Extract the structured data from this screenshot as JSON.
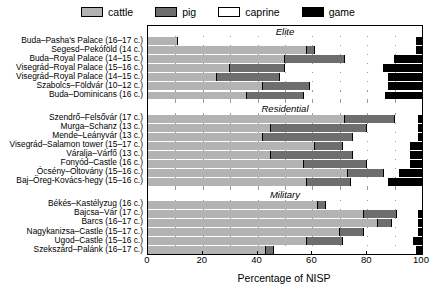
{
  "legend": {
    "items": [
      {
        "label": "cattle",
        "color": "#b3b3b3",
        "icon": "square-swatch-icon"
      },
      {
        "label": "pig",
        "color": "#6e6e6e",
        "icon": "square-swatch-icon"
      },
      {
        "label": "caprine",
        "color": "#ffffff",
        "icon": "square-swatch-icon"
      },
      {
        "label": "game",
        "color": "#000000",
        "icon": "square-swatch-icon"
      }
    ]
  },
  "axis": {
    "x_title": "Percentage of NISP",
    "x_ticks": [
      "0",
      "20",
      "40",
      "60",
      "80",
      "100"
    ],
    "x_min": 0,
    "x_max": 100
  },
  "groups": [
    {
      "name": "Elite"
    },
    {
      "name": "Residential"
    },
    {
      "name": "Military"
    }
  ],
  "chart_data": {
    "type": "bar",
    "orientation": "horizontal",
    "stacked": true,
    "title": "",
    "xlabel": "Percentage of NISP",
    "ylabel": "",
    "xlim": [
      0,
      100
    ],
    "grid": true,
    "legend_position": "top-center",
    "series": [
      {
        "name": "cattle",
        "color": "#b3b3b3"
      },
      {
        "name": "pig",
        "color": "#6e6e6e"
      },
      {
        "name": "caprine",
        "color": "#ffffff"
      },
      {
        "name": "game",
        "color": "#000000"
      }
    ],
    "group_labels": [
      "Elite",
      "Residential",
      "Military"
    ],
    "categories": [
      {
        "group": "Elite",
        "site": "Buda–Pasha's Palace",
        "century": "(16–17 c.)",
        "values": [
          11,
          0,
          87,
          2
        ]
      },
      {
        "group": "Elite",
        "site": "Segesd–Pekóföld",
        "century": "(14 c.)",
        "values": [
          58,
          3,
          37,
          2
        ]
      },
      {
        "group": "Elite",
        "site": "Buda–Royal Palace",
        "century": "(14–15 c.)",
        "values": [
          50,
          22,
          18,
          10
        ]
      },
      {
        "group": "Elite",
        "site": "Visegrád–Royal Palace",
        "century": "(15–16 c.)",
        "values": [
          30,
          20,
          36,
          14
        ]
      },
      {
        "group": "Elite",
        "site": "Visegrád–Royal Palace",
        "century": "(14–15 c.)",
        "values": [
          25,
          23,
          40,
          12
        ]
      },
      {
        "group": "Elite",
        "site": "Szabolcs–Földvár",
        "century": "(10–12 c.)",
        "values": [
          42,
          17,
          29,
          12
        ]
      },
      {
        "group": "Elite",
        "site": "Buda–Dominicans",
        "century": "(16 c.)",
        "values": [
          36,
          21,
          30,
          13
        ]
      },
      {
        "group": "Residential",
        "site": "Szendrő–Felsővár",
        "century": "(17 c.)",
        "values": [
          72,
          18,
          9,
          1
        ]
      },
      {
        "group": "Residential",
        "site": "Murga–Schanz",
        "century": "(13 c.)",
        "values": [
          45,
          35,
          19,
          1
        ]
      },
      {
        "group": "Residential",
        "site": "Mende–Leányvár",
        "century": "(13 c.)",
        "values": [
          42,
          33,
          24,
          1
        ]
      },
      {
        "group": "Residential",
        "site": "Visegrád–Salamon tower",
        "century": "(15–17 c.)",
        "values": [
          61,
          10,
          25,
          4
        ]
      },
      {
        "group": "Residential",
        "site": "Váralja–Várfő",
        "century": "(13 c.)",
        "values": [
          45,
          30,
          21,
          4
        ]
      },
      {
        "group": "Residential",
        "site": "Fonyód–Castle",
        "century": "(16 c.)",
        "values": [
          57,
          23,
          16,
          4
        ]
      },
      {
        "group": "Residential",
        "site": "Ócsény–Oltovány",
        "century": "(15–16 c.)",
        "values": [
          73,
          13,
          6,
          8
        ]
      },
      {
        "group": "Residential",
        "site": "Baj–Öreg-Kovács-hegy",
        "century": "(15–16 c.)",
        "values": [
          58,
          16,
          14,
          12
        ]
      },
      {
        "group": "Military",
        "site": "Békés–Kastélyzug",
        "century": "(16 c.)",
        "values": [
          62,
          3,
          35,
          0
        ]
      },
      {
        "group": "Military",
        "site": "Bajcsa–Vár",
        "century": "(17 c.)",
        "values": [
          79,
          12,
          8,
          1
        ]
      },
      {
        "group": "Military",
        "site": "Barcs",
        "century": "(16–17 c.)",
        "values": [
          84,
          5,
          10,
          1
        ]
      },
      {
        "group": "Military",
        "site": "Nagykanizsa–Castle",
        "century": "(15–17 c.)",
        "values": [
          70,
          9,
          20,
          1
        ]
      },
      {
        "group": "Military",
        "site": "Ugod–Castle",
        "century": "(15–16 c.)",
        "values": [
          58,
          13,
          26,
          3
        ]
      },
      {
        "group": "Military",
        "site": "Szekszárd–Palánk",
        "century": "(16–17 c.)",
        "values": [
          43,
          3,
          52,
          2
        ]
      }
    ]
  }
}
